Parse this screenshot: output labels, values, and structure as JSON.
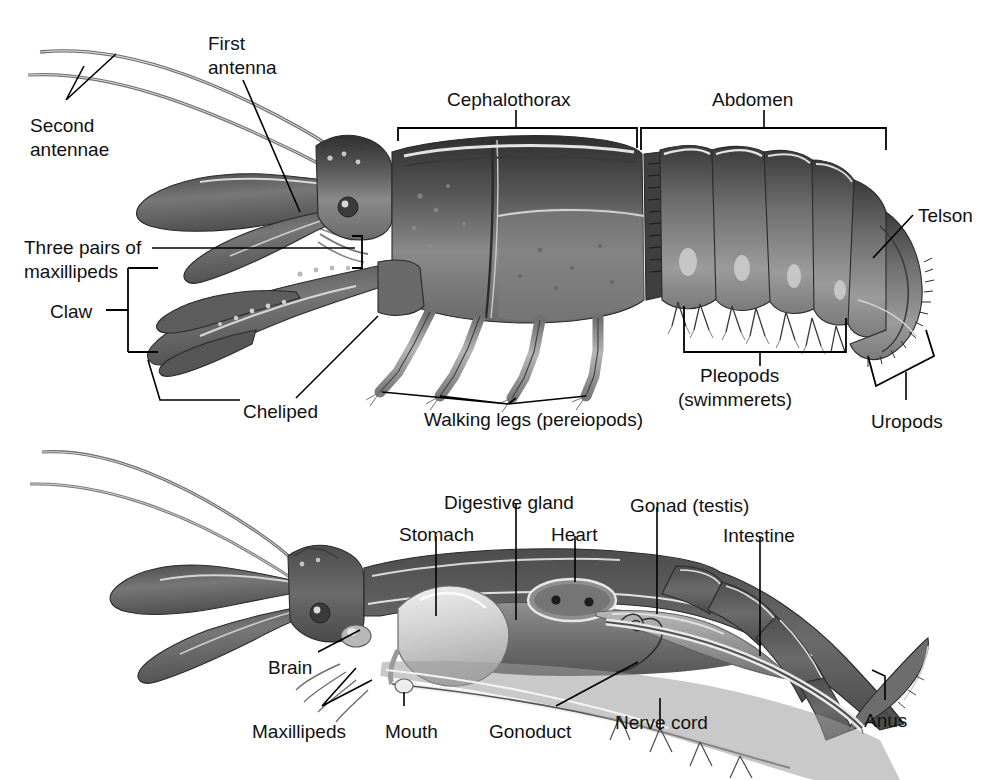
{
  "figure": {
    "background_color": "#ffffff",
    "ink_color": "#111111",
    "panels": [
      {
        "id": "external",
        "name": "external-anatomy-panel",
        "labels": [
          {
            "id": "second-antennae",
            "text": "Second\nantennae",
            "line1": "Second",
            "line2": "antennae",
            "x": 30,
            "y": 115,
            "type": "text-two-line"
          },
          {
            "id": "first-antenna",
            "text": "First\nantenna",
            "line1": "First",
            "line2": "antenna",
            "x": 208,
            "y": 28,
            "type": "text-two-line"
          },
          {
            "id": "cephalothorax",
            "text": "Cephalothorax",
            "x": 447,
            "y": 88,
            "type": "bracket-label"
          },
          {
            "id": "abdomen",
            "text": "Abdomen",
            "x": 744,
            "y": 88,
            "type": "bracket-label"
          },
          {
            "id": "telson",
            "text": "Telson",
            "x": 918,
            "y": 205,
            "type": "leader-label"
          },
          {
            "id": "three-pairs-of-maxillipeds",
            "text": "Three pairs of\nmaxillipeds",
            "line1": "Three pairs of",
            "line2": "maxillipeds",
            "x": 24,
            "y": 237,
            "type": "text-two-line"
          },
          {
            "id": "claw",
            "text": "Claw",
            "x": 50,
            "y": 310,
            "type": "bracket-label"
          },
          {
            "id": "cheliped",
            "text": "Cheliped",
            "x": 243,
            "y": 408,
            "type": "leader-label"
          },
          {
            "id": "walking-legs",
            "text": "Walking legs (pereiopods)",
            "x": 424,
            "y": 415,
            "type": "leader-label"
          },
          {
            "id": "pleopods",
            "text": "Pleopods\n(swimmerets)",
            "line1": "Pleopods",
            "line2": "(swimmerets)",
            "x": 692,
            "y": 364,
            "type": "bracket-label"
          },
          {
            "id": "uropods",
            "text": "Uropods",
            "x": 871,
            "y": 412,
            "type": "bracket-label"
          }
        ]
      },
      {
        "id": "internal",
        "name": "internal-anatomy-panel",
        "labels": [
          {
            "id": "stomach",
            "text": "Stomach",
            "x": 399,
            "y": 526,
            "type": "leader-label"
          },
          {
            "id": "digestive-gland",
            "text": "Digestive gland",
            "x": 444,
            "y": 494,
            "type": "leader-label"
          },
          {
            "id": "heart",
            "text": "Heart",
            "x": 551,
            "y": 526,
            "type": "leader-label"
          },
          {
            "id": "gonad-testis",
            "text": "Gonad (testis)",
            "x": 637,
            "y": 497,
            "type": "leader-label"
          },
          {
            "id": "intestine",
            "text": "Intestine",
            "x": 725,
            "y": 527,
            "type": "leader-label"
          },
          {
            "id": "brain",
            "text": "Brain",
            "x": 268,
            "y": 659,
            "type": "leader-label"
          },
          {
            "id": "maxillipeds",
            "text": "Maxillipeds",
            "x": 252,
            "y": 723,
            "type": "leader-label"
          },
          {
            "id": "mouth",
            "text": "Mouth",
            "x": 385,
            "y": 723,
            "type": "leader-label"
          },
          {
            "id": "gonoduct",
            "text": "Gonoduct",
            "x": 489,
            "y": 723,
            "type": "leader-label"
          },
          {
            "id": "nerve-cord",
            "text": "Nerve cord",
            "x": 615,
            "y": 714,
            "type": "leader-label"
          },
          {
            "id": "anus",
            "text": "Anus",
            "x": 864,
            "y": 712,
            "type": "leader-label"
          }
        ]
      }
    ]
  }
}
